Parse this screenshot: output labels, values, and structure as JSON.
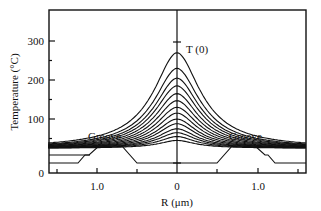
{
  "chart_data": {
    "type": "line",
    "title": "",
    "xlabel": "R (μm)",
    "ylabel": "Temperature (°C)",
    "xlim": [
      -1.6,
      1.6
    ],
    "ylim": [
      0,
      370
    ],
    "x_tick_labels": [
      "1.0",
      "0",
      "1.0"
    ],
    "x_tick_values": [
      -1.0,
      0,
      1.0
    ],
    "x_minor_ticks": [
      -1.5,
      -0.5,
      0.5,
      1.5
    ],
    "y_tick_labels": [
      "0",
      "100",
      "200",
      "300"
    ],
    "y_tick_values": [
      0,
      100,
      200,
      300
    ],
    "grid": false,
    "legend": null,
    "annotations": [
      {
        "text": "T (0)",
        "x": 0.1,
        "y": 275
      },
      {
        "text": "Groove",
        "x": -0.95,
        "y": 68
      },
      {
        "text": "Groove",
        "x": 0.95,
        "y": 68
      }
    ],
    "series_description": "Family of symmetric temperature profiles vs radial distance R, peaked at R=0; peak temperatures increase from ~45 °C to T(0) ≈ 270 °C; all converge to ~25 °C far from center.",
    "series": [
      {
        "name": "curve 1",
        "peak": 45,
        "baseline": 25
      },
      {
        "name": "curve 2",
        "peak": 55,
        "baseline": 25
      },
      {
        "name": "curve 3",
        "peak": 65,
        "baseline": 25
      },
      {
        "name": "curve 4",
        "peak": 75,
        "baseline": 25
      },
      {
        "name": "curve 5",
        "peak": 88,
        "baseline": 25
      },
      {
        "name": "curve 6",
        "peak": 100,
        "baseline": 25
      },
      {
        "name": "curve 7",
        "peak": 115,
        "baseline": 25
      },
      {
        "name": "curve 8",
        "peak": 130,
        "baseline": 25
      },
      {
        "name": "curve 9",
        "peak": 147,
        "baseline": 25
      },
      {
        "name": "curve 10",
        "peak": 165,
        "baseline": 25
      },
      {
        "name": "curve 11",
        "peak": 185,
        "baseline": 25
      },
      {
        "name": "curve 12",
        "peak": 205,
        "baseline": 25
      },
      {
        "name": "curve 13",
        "peak": 230,
        "baseline": 25
      },
      {
        "name": "curve 14 T(0)",
        "peak": 270,
        "baseline": 25
      }
    ],
    "groove_outline": {
      "description": "Trapezoidal groove profiles drawn on both sides (schematic of substrate grooves)",
      "left": [
        [
          -1.6,
          15
        ],
        [
          -1.25,
          15
        ],
        [
          -1.05,
          40
        ],
        [
          -0.75,
          40
        ],
        [
          -0.55,
          15
        ],
        [
          0.55,
          15
        ],
        [
          0.75,
          40
        ],
        [
          1.05,
          40
        ],
        [
          1.25,
          15
        ],
        [
          1.6,
          15
        ]
      ]
    }
  },
  "labels": {
    "y_axis_title": "Temperature (°C)",
    "x_axis_title": "R (μm)",
    "peak_label": "T (0)",
    "groove_left": "Groove",
    "groove_right": "Groove",
    "y_ticks": [
      "300",
      "200",
      "100",
      "0"
    ],
    "x_ticks": [
      "1.0",
      "0",
      "1.0"
    ]
  }
}
